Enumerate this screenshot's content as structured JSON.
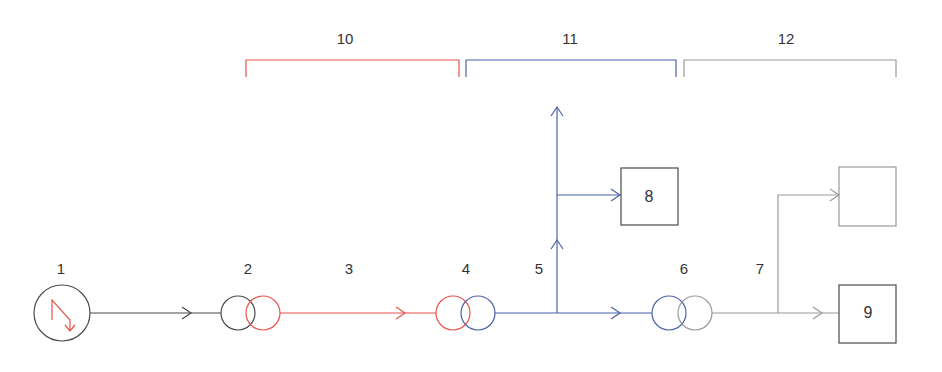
{
  "colors": {
    "black": "#4a4a4a",
    "red": "#e8534a",
    "blue": "#4a62a8",
    "gray": "#9a9a9a"
  },
  "sections": [
    {
      "id": "10",
      "label": "10",
      "color": "red"
    },
    {
      "id": "11",
      "label": "11",
      "color": "blue"
    },
    {
      "id": "12",
      "label": "12",
      "color": "gray"
    }
  ],
  "nodes": {
    "generator": {
      "label": "1",
      "icon": "generator-lightning-icon"
    },
    "step_up_transformer": {
      "label": "2"
    },
    "transmission_line": {
      "label": "3"
    },
    "step_down_transformer": {
      "label": "4"
    },
    "distribution_line": {
      "label": "5"
    },
    "distribution_transformer": {
      "label": "6"
    },
    "low_voltage_line": {
      "label": "7"
    },
    "consumer_box_8": {
      "label": "8"
    },
    "consumer_box_9": {
      "label": "9"
    },
    "consumer_box_unlabeled": {
      "label": ""
    }
  }
}
